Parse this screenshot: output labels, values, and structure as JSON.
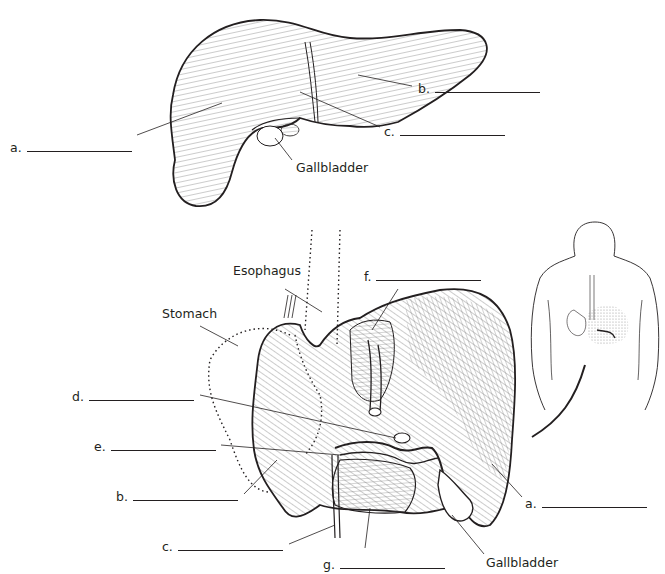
{
  "diagram": {
    "colors": {
      "ink": "#231f20",
      "hatch": "#555555",
      "stipple": "#bbbbbb",
      "background": "#ffffff"
    },
    "top_view": {
      "labels": [
        {
          "id": "a",
          "text": "a.",
          "blank": true
        },
        {
          "id": "b",
          "text": "b.",
          "blank": true
        },
        {
          "id": "c",
          "text": "c.",
          "blank": true
        },
        {
          "id": "gallbladder",
          "text": "Gallbladder",
          "blank": false
        }
      ]
    },
    "bottom_view": {
      "labels": [
        {
          "id": "esophagus",
          "text": "Esophagus",
          "blank": false
        },
        {
          "id": "stomach",
          "text": "Stomach",
          "blank": false
        },
        {
          "id": "f",
          "text": "f.",
          "blank": true
        },
        {
          "id": "d",
          "text": "d.",
          "blank": true
        },
        {
          "id": "e",
          "text": "e.",
          "blank": true
        },
        {
          "id": "b",
          "text": "b.",
          "blank": true
        },
        {
          "id": "c",
          "text": "c.",
          "blank": true
        },
        {
          "id": "g",
          "text": "g.",
          "blank": true
        },
        {
          "id": "a",
          "text": "a.",
          "blank": true
        },
        {
          "id": "gallbladder",
          "text": "Gallbladder",
          "blank": false
        }
      ]
    },
    "inset": {
      "description": "posterior body view with liver, stomach and esophagus location"
    }
  }
}
